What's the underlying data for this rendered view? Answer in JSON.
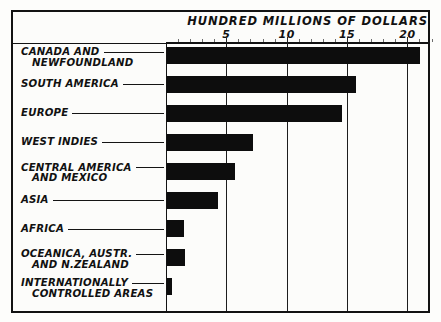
{
  "chart_data": {
    "type": "bar",
    "orientation": "horizontal",
    "title": "HUNDRED MILLIONS OF DOLLARS",
    "xlabel": "HUNDRED MILLIONS OF DOLLARS",
    "ylabel": "",
    "xlim": [
      0,
      22
    ],
    "grid": true,
    "legend": "none",
    "xticks": [
      5,
      10,
      15,
      20
    ],
    "xtick_labels": [
      "5",
      "10",
      "15",
      "20"
    ],
    "minor_tick_step": 1,
    "categories": [
      "CANADA AND NEWFOUNDLAND",
      "SOUTH AMERICA",
      "EUROPE",
      "WEST INDIES",
      "CENTRAL AMERICA AND MEXICO",
      "ASIA",
      "AFRICA",
      "OCEANICA, AUSTR. AND N.ZEALAND",
      "INTERNATIONALLY CONTROLLED AREAS"
    ],
    "values": [
      21.0,
      15.7,
      14.5,
      7.1,
      5.6,
      4.2,
      1.4,
      1.5,
      0.4
    ],
    "bar_color": "#0d0d0d"
  },
  "axis": {
    "title": "HUNDRED MILLIONS OF DOLLARS",
    "ticks": [
      {
        "value": 5,
        "label": "5"
      },
      {
        "value": 10,
        "label": "10"
      },
      {
        "value": 15,
        "label": "15"
      },
      {
        "value": 20,
        "label": "20"
      }
    ]
  },
  "rows": [
    {
      "line1": "CANADA AND",
      "line2": "NEWFOUNDLAND",
      "value": 21.0
    },
    {
      "line1": "SOUTH AMERICA",
      "line2": "",
      "value": 15.7
    },
    {
      "line1": "EUROPE",
      "line2": "",
      "value": 14.5
    },
    {
      "line1": "WEST INDIES",
      "line2": "",
      "value": 7.1
    },
    {
      "line1": "CENTRAL AMERICA",
      "line2": "AND MEXICO",
      "value": 5.6
    },
    {
      "line1": "ASIA",
      "line2": "",
      "value": 4.2
    },
    {
      "line1": "AFRICA",
      "line2": "",
      "value": 1.4
    },
    {
      "line1": "OCEANICA, AUSTR.",
      "line2": "AND N.ZEALAND",
      "value": 1.5
    },
    {
      "line1": "INTERNATIONALLY",
      "line2": "CONTROLLED AREAS",
      "value": 0.4
    }
  ],
  "colors": {
    "bar": "#0d0d0d",
    "frame": "#121212",
    "paper": "#fcfcfa",
    "gridline": "#1d1d1d"
  }
}
